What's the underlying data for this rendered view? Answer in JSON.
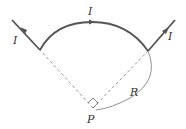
{
  "diagram": {
    "type": "physics-circuit-geometry",
    "labels": {
      "current_left": "I",
      "current_arc": "I",
      "current_right": "I",
      "radius": "R",
      "point": "P"
    },
    "colors": {
      "wire": "#555555",
      "dashed": "#888888",
      "thin_arc": "#777777",
      "text": "#333333"
    },
    "elements": {
      "left_wire": "straight wire segment entering with current arrow",
      "top_arc": "quarter-circle arc of wire centered at P",
      "right_wire": "straight wire segment leaving with current arrow",
      "radius_lines": "dashed radii from P to arc endpoints",
      "right_angle": "right-angle marker at P",
      "radius_arc": "thin arc indicating radius R"
    }
  }
}
